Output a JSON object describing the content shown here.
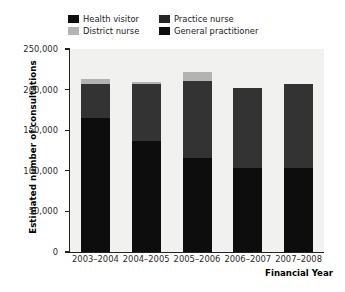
{
  "chart_data": {
    "type": "bar",
    "subtype": "stacked-bar",
    "title": "",
    "xlabel": "Financial Year",
    "ylabel": "Estimated number of consultations",
    "categories": [
      "2003–2004",
      "2004–2005",
      "2005–2006",
      "2006–2007",
      "2007–2008"
    ],
    "series": [
      {
        "name": "General practitioner",
        "color": "#0d0d0d",
        "values": [
          165000,
          137000,
          116000,
          103000,
          103000
        ]
      },
      {
        "name": "Practice nurse",
        "color": "#333333",
        "values": [
          42000,
          70000,
          95000,
          99000,
          104000
        ]
      },
      {
        "name": "District nurse",
        "color": "#b3b3b3",
        "values": [
          6000,
          3000,
          11000,
          0,
          0
        ]
      },
      {
        "name": "Health visitor",
        "color": "#0d0d0d",
        "values": [
          0,
          0,
          0,
          0,
          0
        ]
      }
    ],
    "totals": [
      213000,
      210000,
      222000,
      202000,
      207000
    ],
    "ylim": [
      0,
      250000
    ],
    "ytick_values": [
      0,
      50000,
      100000,
      150000,
      200000,
      250000
    ],
    "ytick_labels": [
      "0",
      "50,000",
      "100,000",
      "150,000",
      "200,000",
      "250,000"
    ],
    "grid": false,
    "legend_position": "top",
    "legend_order": [
      "Health visitor",
      "Practice nurse",
      "District nurse",
      "General practitioner"
    ],
    "plot_background": "#f1f1ef",
    "axis_color": "#222222"
  },
  "legend": {
    "entries": [
      {
        "label": "Health visitor",
        "color": "#0d0d0d"
      },
      {
        "label": "Practice nurse",
        "color": "#262626"
      },
      {
        "label": "District nurse",
        "color": "#b3b3b3"
      },
      {
        "label": "General practitioner",
        "color": "#0d0d0d"
      }
    ]
  }
}
